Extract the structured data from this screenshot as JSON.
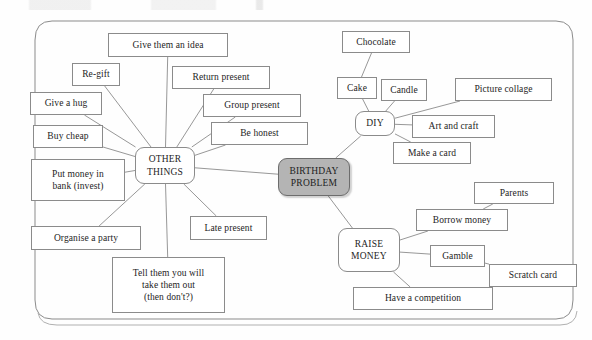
{
  "diagram": {
    "frame": {
      "type": "rounded-rectangle-border"
    },
    "colors": {
      "center_fill": "#b4b4b4",
      "node_fill": "#ffffff",
      "stroke": "#8b8b8b",
      "text": "#242424",
      "background": "#fefefe"
    },
    "center": {
      "label": "BIRTHDAY\nPROBLEM",
      "x": 278,
      "y": 158,
      "w": 72,
      "h": 38
    },
    "hubs": [
      {
        "id": "other-things",
        "label": "OTHER\nTHINGS",
        "x": 135,
        "y": 147,
        "w": 60,
        "h": 37
      },
      {
        "id": "diy",
        "label": "DIY",
        "x": 355,
        "y": 111,
        "w": 40,
        "h": 25
      },
      {
        "id": "raise-money",
        "label": "RAISE\nMONEY",
        "x": 338,
        "y": 228,
        "w": 62,
        "h": 44
      }
    ],
    "nodes": [
      {
        "id": "give-them-an-idea",
        "label": "Give them an idea",
        "x": 108,
        "y": 33,
        "w": 120,
        "h": 24,
        "branch": "other-things"
      },
      {
        "id": "re-gift",
        "label": "Re-gift",
        "x": 72,
        "y": 63,
        "w": 48,
        "h": 23,
        "branch": "other-things"
      },
      {
        "id": "return-present",
        "label": "Return present",
        "x": 172,
        "y": 66,
        "w": 98,
        "h": 23,
        "branch": "other-things"
      },
      {
        "id": "give-a-hug",
        "label": "Give a hug",
        "x": 30,
        "y": 92,
        "w": 72,
        "h": 23,
        "branch": "other-things"
      },
      {
        "id": "group-present",
        "label": "Group present",
        "x": 203,
        "y": 94,
        "w": 98,
        "h": 23,
        "branch": "other-things"
      },
      {
        "id": "buy-cheap",
        "label": "Buy cheap",
        "x": 33,
        "y": 125,
        "w": 70,
        "h": 23,
        "branch": "other-things"
      },
      {
        "id": "be-honest",
        "label": "Be honest",
        "x": 211,
        "y": 122,
        "w": 97,
        "h": 23,
        "branch": "other-things"
      },
      {
        "id": "put-money-in-bank",
        "label": "Put money in\nbank (invest)",
        "x": 31,
        "y": 159,
        "w": 94,
        "h": 42,
        "branch": "other-things"
      },
      {
        "id": "organise-a-party",
        "label": "Organise a party",
        "x": 31,
        "y": 226,
        "w": 110,
        "h": 24,
        "branch": "other-things"
      },
      {
        "id": "late-present",
        "label": "Late present",
        "x": 190,
        "y": 216,
        "w": 77,
        "h": 24,
        "branch": "other-things"
      },
      {
        "id": "tell-them-take-out",
        "label": "Tell them you will\ntake them out\n(then don't?)",
        "x": 112,
        "y": 257,
        "w": 113,
        "h": 56,
        "branch": "other-things"
      },
      {
        "id": "chocolate",
        "label": "Chocolate",
        "x": 342,
        "y": 31,
        "w": 68,
        "h": 22,
        "branch": "diy"
      },
      {
        "id": "cake",
        "label": "Cake",
        "x": 337,
        "y": 77,
        "w": 40,
        "h": 22,
        "branch": "diy"
      },
      {
        "id": "candle",
        "label": "Candle",
        "x": 381,
        "y": 79,
        "w": 46,
        "h": 22,
        "branch": "diy"
      },
      {
        "id": "picture-collage",
        "label": "Picture collage",
        "x": 455,
        "y": 78,
        "w": 97,
        "h": 23,
        "branch": "diy"
      },
      {
        "id": "art-and-craft",
        "label": "Art and craft",
        "x": 412,
        "y": 115,
        "w": 83,
        "h": 23,
        "branch": "diy"
      },
      {
        "id": "make-a-card",
        "label": "Make a card",
        "x": 393,
        "y": 142,
        "w": 78,
        "h": 22,
        "branch": "diy"
      },
      {
        "id": "parents",
        "label": "Parents",
        "x": 474,
        "y": 182,
        "w": 80,
        "h": 22,
        "branch": "raise-money"
      },
      {
        "id": "borrow-money",
        "label": "Borrow money",
        "x": 416,
        "y": 209,
        "w": 92,
        "h": 22,
        "branch": "raise-money"
      },
      {
        "id": "gamble",
        "label": "Gamble",
        "x": 430,
        "y": 245,
        "w": 55,
        "h": 22,
        "branch": "raise-money"
      },
      {
        "id": "scratch-card",
        "label": "Scratch card",
        "x": 489,
        "y": 264,
        "w": 88,
        "h": 23,
        "branch": "raise-money"
      },
      {
        "id": "have-a-competition",
        "label": "Have a competition",
        "x": 353,
        "y": 287,
        "w": 140,
        "h": 23,
        "branch": "raise-money"
      }
    ],
    "links": [
      {
        "from": "center",
        "to": "other-things"
      },
      {
        "from": "center",
        "to": "diy"
      },
      {
        "from": "center",
        "to": "raise-money"
      },
      {
        "from": "other-things",
        "to": "give-them-an-idea"
      },
      {
        "from": "other-things",
        "to": "re-gift"
      },
      {
        "from": "other-things",
        "to": "return-present"
      },
      {
        "from": "other-things",
        "to": "give-a-hug"
      },
      {
        "from": "other-things",
        "to": "group-present"
      },
      {
        "from": "other-things",
        "to": "buy-cheap"
      },
      {
        "from": "other-things",
        "to": "be-honest"
      },
      {
        "from": "other-things",
        "to": "put-money-in-bank"
      },
      {
        "from": "other-things",
        "to": "organise-a-party"
      },
      {
        "from": "other-things",
        "to": "late-present"
      },
      {
        "from": "other-things",
        "to": "tell-them-take-out"
      },
      {
        "from": "diy",
        "to": "cake"
      },
      {
        "from": "cake",
        "to": "chocolate"
      },
      {
        "from": "diy",
        "to": "candle"
      },
      {
        "from": "diy",
        "to": "picture-collage"
      },
      {
        "from": "diy",
        "to": "art-and-craft"
      },
      {
        "from": "diy",
        "to": "make-a-card"
      },
      {
        "from": "raise-money",
        "to": "borrow-money"
      },
      {
        "from": "borrow-money",
        "to": "parents"
      },
      {
        "from": "raise-money",
        "to": "gamble"
      },
      {
        "from": "gamble",
        "to": "scratch-card"
      },
      {
        "from": "raise-money",
        "to": "have-a-competition"
      }
    ]
  }
}
